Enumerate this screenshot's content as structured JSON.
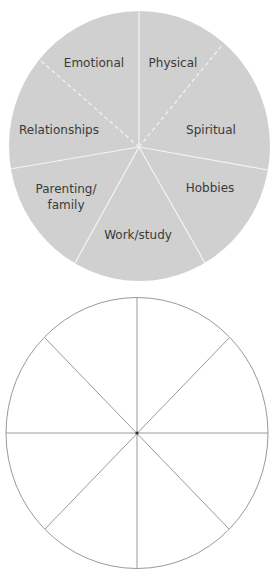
{
  "wheel_filled": {
    "fill_color": "#d0d0d0",
    "divider_color": "#f4f4f4",
    "segments": [
      {
        "label": "Emotional"
      },
      {
        "label": "Physical"
      },
      {
        "label": "Relationships"
      },
      {
        "label": "Spiritual"
      },
      {
        "label": "Parenting/",
        "label_line2": "family"
      },
      {
        "label": "Hobbies"
      },
      {
        "label": "Work/study"
      }
    ]
  },
  "wheel_blank": {
    "segment_count": 8,
    "line_color": "#9a9a9a"
  }
}
